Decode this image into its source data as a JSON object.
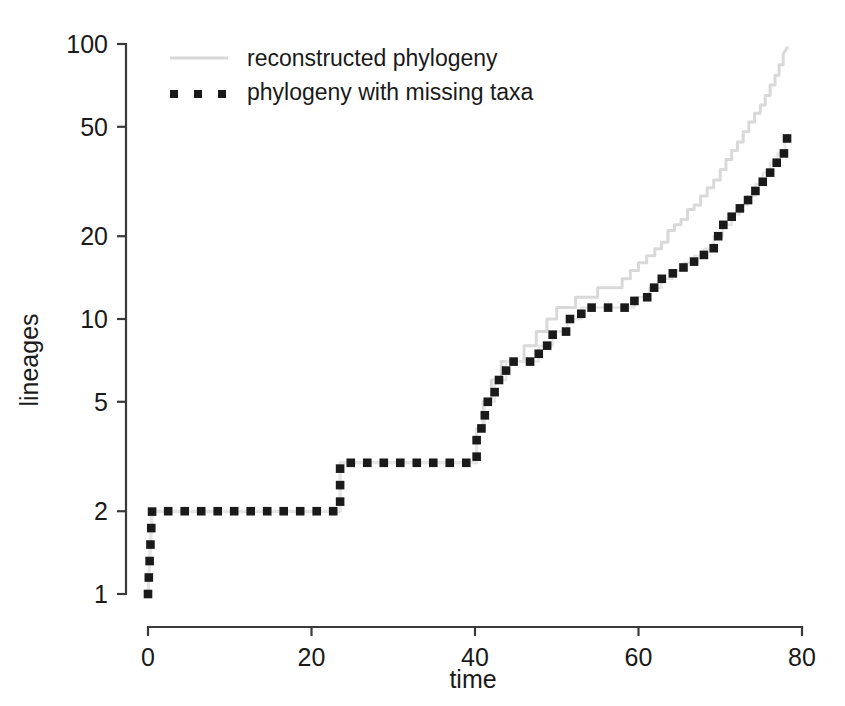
{
  "chart_data": {
    "type": "line",
    "title": "",
    "subtitle": "",
    "xlabel": "time",
    "ylabel": "lineages",
    "xlim": [
      0,
      80
    ],
    "ylim": [
      1,
      100
    ],
    "yscale": "log",
    "grid": false,
    "legend_position": "top-left",
    "xticks": [
      0,
      20,
      40,
      60,
      80
    ],
    "xtick_labels": [
      "0",
      "20",
      "40",
      "60",
      "80"
    ],
    "yticks": [
      1,
      2,
      5,
      10,
      20,
      50,
      100
    ],
    "ytick_labels": [
      "1",
      "2",
      "5",
      "10",
      "20",
      "50",
      "100"
    ],
    "series": [
      {
        "name": "reconstructed phylogeny",
        "style": "step-line",
        "color": "#d9d9d9",
        "x": [
          0,
          0.5,
          23.5,
          23.5,
          40.2,
          40.2,
          41.0,
          41.0,
          42.0,
          42.0,
          43.2,
          43.2,
          44.5,
          44.5,
          46.0,
          46.0,
          47.5,
          47.5,
          48.8,
          48.8,
          50.0,
          50.0,
          51.2,
          51.2,
          52.3,
          52.3,
          53.5,
          53.5,
          55.0,
          55.0,
          56.5,
          56.5,
          58.0,
          58.0,
          59.0,
          59.0,
          60.0,
          60.0,
          61.0,
          61.0,
          62.0,
          62.0,
          62.8,
          62.8,
          63.6,
          63.6,
          64.4,
          64.4,
          65.2,
          65.2,
          66.0,
          66.0,
          66.8,
          66.8,
          67.6,
          67.6,
          68.4,
          68.4,
          69.2,
          69.2,
          70.0,
          70.0,
          70.7,
          70.7,
          71.4,
          71.4,
          72.1,
          72.1,
          72.8,
          72.8,
          73.5,
          73.5,
          74.2,
          74.2,
          74.9,
          74.9,
          75.5,
          75.5,
          76.1,
          76.1,
          76.7,
          76.7,
          77.2,
          77.2,
          77.7,
          77.7,
          78.2
        ],
        "y": [
          1,
          2,
          2,
          3,
          3,
          4,
          4,
          5,
          5,
          6,
          6,
          7,
          7,
          7,
          7,
          8,
          8,
          9,
          9,
          10,
          10,
          11,
          11,
          11,
          11,
          12,
          12,
          12,
          12,
          13,
          13,
          13,
          13,
          14,
          14,
          15,
          15,
          16,
          16,
          17,
          17,
          18,
          18,
          19,
          19,
          21,
          21,
          22,
          22,
          23,
          23,
          25,
          25,
          26,
          26,
          28,
          28,
          30,
          30,
          32,
          32,
          35,
          35,
          38,
          38,
          41,
          41,
          44,
          44,
          48,
          48,
          52,
          52,
          56,
          56,
          60,
          60,
          65,
          65,
          71,
          71,
          77,
          77,
          84,
          84,
          92,
          97
        ]
      },
      {
        "name": "phylogeny with missing taxa",
        "style": "step-dotted",
        "color": "#1a1a1a",
        "x": [
          0,
          0.5,
          23.5,
          23.5,
          40.2,
          40.2,
          41.2,
          41.2,
          42.4,
          42.4,
          43.8,
          43.8,
          45.6,
          45.6,
          47.8,
          47.8,
          49.5,
          49.5,
          51.3,
          51.3,
          53.0,
          53.0,
          59.5,
          59.5,
          61.3,
          61.3,
          62.8,
          62.8,
          64.2,
          64.2,
          65.5,
          65.5,
          66.8,
          66.8,
          68.0,
          68.0,
          69.2,
          69.2,
          70.3,
          70.3,
          71.4,
          71.4,
          72.4,
          72.4,
          73.4,
          73.4,
          74.3,
          74.3,
          75.2,
          75.2,
          76.1,
          76.1,
          77.0,
          77.0,
          77.9,
          77.9,
          78.3
        ],
        "y": [
          1,
          2,
          2,
          3,
          3,
          4,
          4,
          5,
          5,
          6,
          6,
          7,
          7,
          7,
          7,
          8,
          8,
          9,
          9,
          10,
          10,
          11,
          11,
          12,
          12,
          13,
          13,
          14,
          14,
          15,
          15,
          16,
          16,
          17,
          17,
          18,
          18,
          20,
          20,
          22,
          22,
          24,
          24,
          26,
          26,
          28,
          28,
          31,
          31,
          34,
          34,
          37,
          37,
          40,
          40,
          44,
          46
        ]
      }
    ]
  },
  "axes": {
    "y_title": "lineages",
    "x_title": "time"
  },
  "legend": {
    "entries": [
      {
        "label": "reconstructed phylogeny",
        "marker": "solid-line",
        "color": "#d9d9d9"
      },
      {
        "label": "phylogeny with missing taxa",
        "marker": "square-dots",
        "color": "#1a1a1a"
      }
    ]
  }
}
